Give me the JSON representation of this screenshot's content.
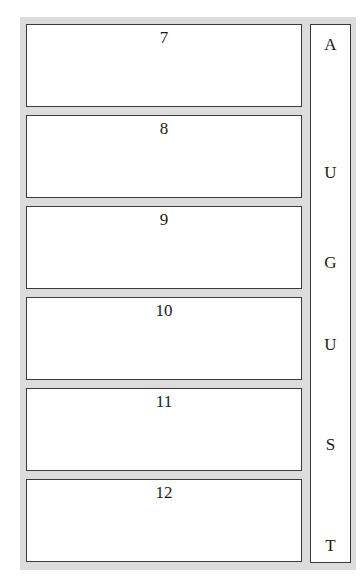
{
  "calendar": {
    "month_letters": [
      "A",
      "U",
      "G",
      "U",
      "S",
      "T"
    ],
    "month_letter_tops": [
      10,
      138,
      228,
      310,
      410,
      511
    ],
    "days": [
      {
        "number": "7",
        "top": 24
      },
      {
        "number": "8",
        "top": 115
      },
      {
        "number": "9",
        "top": 206
      },
      {
        "number": "10",
        "top": 297
      },
      {
        "number": "11",
        "top": 388
      },
      {
        "number": "12",
        "top": 479
      }
    ]
  },
  "colors": {
    "frame": "#dcdcdc",
    "border": "#3a3a3a",
    "paper": "#ffffff",
    "text": "#1a1a1a"
  }
}
